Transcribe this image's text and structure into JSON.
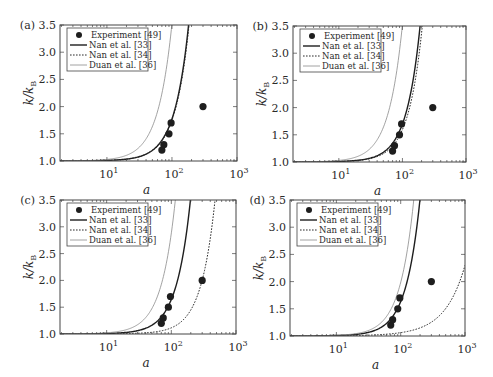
{
  "figure": {
    "width": 493,
    "height": 377
  },
  "legend": {
    "entries": [
      {
        "label": "Experiment [49]",
        "style": "marker"
      },
      {
        "label": "Nan et al. [33]",
        "style": "solid-thick"
      },
      {
        "label": "Nan et al. [34]",
        "style": "dotted"
      },
      {
        "label": "Duan et al. [36]",
        "style": "solid-thin"
      }
    ]
  },
  "colors": {
    "frame": "#444444",
    "experiment": "#1e1e1e",
    "nan33": "#1e1e1e",
    "nan34": "#2a2a2a",
    "duan36": "#8a8a8a"
  },
  "chart_data": [
    {
      "type": "line",
      "panel_label": "(a)",
      "xlabel": "a",
      "ylabel": "k/k_B",
      "xscale": "log",
      "xlim": [
        1.9,
        1000
      ],
      "ylim": [
        1.0,
        3.5
      ],
      "xticks": [
        "10^1",
        "10^2",
        "10^3"
      ],
      "yticks": [
        "1.0",
        "1.5",
        "2.0",
        "2.5",
        "3.0",
        "3.5"
      ],
      "grid": false,
      "legend_position": "upper left",
      "frame_px": {
        "left": 60,
        "top": 25,
        "right": 237,
        "bottom": 161
      },
      "series": [
        {
          "name": "Experiment [49]",
          "kind": "scatter",
          "x": [
            70,
            75,
            90,
            97,
            300
          ],
          "y": [
            1.2,
            1.3,
            1.5,
            1.7,
            2.0
          ]
        },
        {
          "name": "Nan et al. [33]",
          "kind": "line",
          "a0": 114,
          "a_at_3_5": 180
        },
        {
          "name": "Nan et al. [34]",
          "kind": "line",
          "a0": 116,
          "a_at_3_5": 183
        },
        {
          "name": "Duan et al. [36]",
          "kind": "line",
          "a0": 63,
          "a_at_3_5": 100
        }
      ]
    },
    {
      "type": "line",
      "panel_label": "(b)",
      "xlabel": "a",
      "ylabel": "k/k_B",
      "xscale": "log",
      "xlim": [
        1.9,
        1000
      ],
      "ylim": [
        1.0,
        3.5
      ],
      "xticks": [
        "10^1",
        "10^2",
        "10^3"
      ],
      "yticks": [
        "1.0",
        "1.5",
        "2.0",
        "2.5",
        "3.0",
        "3.5"
      ],
      "grid": false,
      "legend_position": "upper left",
      "frame_px": {
        "left": 293,
        "top": 26,
        "right": 466,
        "bottom": 162
      },
      "series": [
        {
          "name": "Experiment [49]",
          "kind": "scatter",
          "x": [
            70,
            75,
            90,
            97,
            300
          ],
          "y": [
            1.2,
            1.3,
            1.5,
            1.7,
            2.0
          ]
        },
        {
          "name": "Nan et al. [33]",
          "kind": "line",
          "a0": 120,
          "a_at_3_5": 190
        },
        {
          "name": "Nan et al. [34]",
          "kind": "line",
          "a0": 130,
          "a_at_3_5": 205
        },
        {
          "name": "Duan et al. [36]",
          "kind": "line",
          "a0": 63,
          "a_at_3_5": 100
        }
      ]
    },
    {
      "type": "line",
      "panel_label": "(c)",
      "xlabel": "a",
      "ylabel": "k/k_B",
      "xscale": "log",
      "xlim": [
        1.9,
        1000
      ],
      "ylim": [
        1.0,
        3.5
      ],
      "xticks": [
        "10^1",
        "10^2",
        "10^3"
      ],
      "yticks": [
        "1.0",
        "1.5",
        "2.0",
        "2.5",
        "3.0",
        "3.5"
      ],
      "grid": false,
      "legend_position": "upper left",
      "frame_px": {
        "left": 60,
        "top": 200,
        "right": 236,
        "bottom": 334
      },
      "series": [
        {
          "name": "Experiment [49]",
          "kind": "scatter",
          "x": [
            70,
            75,
            90,
            97,
            300
          ],
          "y": [
            1.2,
            1.3,
            1.5,
            1.7,
            2.0
          ]
        },
        {
          "name": "Nan et al. [33]",
          "kind": "line",
          "a0": 125,
          "a_at_3_5": 198
        },
        {
          "name": "Nan et al. [34]",
          "kind": "line",
          "a0": 300,
          "a_at_3_5": 475
        },
        {
          "name": "Duan et al. [36]",
          "kind": "line",
          "a0": 73,
          "a_at_3_5": 115
        }
      ]
    },
    {
      "type": "line",
      "panel_label": "(d)",
      "xlabel": "a",
      "ylabel": "k/k_B",
      "xscale": "log",
      "xlim": [
        1.9,
        1000
      ],
      "ylim": [
        1.0,
        3.5
      ],
      "xticks": [
        "10^1",
        "10^2",
        "10^3"
      ],
      "yticks": [
        "1.0",
        "1.5",
        "2.0",
        "2.5",
        "3.0",
        "3.5"
      ],
      "grid": false,
      "legend_position": "upper left",
      "frame_px": {
        "left": 290,
        "top": 200,
        "right": 465,
        "bottom": 336
      },
      "series": [
        {
          "name": "Experiment [49]",
          "kind": "scatter",
          "x": [
            70,
            75,
            90,
            97,
            300
          ],
          "y": [
            1.2,
            1.3,
            1.5,
            1.7,
            2.0
          ]
        },
        {
          "name": "Nan et al. [33]",
          "kind": "line",
          "a0": 126,
          "a_at_3_5": 200
        },
        {
          "name": "Nan et al. [34]",
          "kind": "line",
          "a0": 1000,
          "a_at_3_5": null,
          "y_at_1000": 2.0
        },
        {
          "name": "Duan et al. [36]",
          "kind": "line",
          "a0": 101,
          "a_at_3_5": 160
        }
      ]
    }
  ]
}
